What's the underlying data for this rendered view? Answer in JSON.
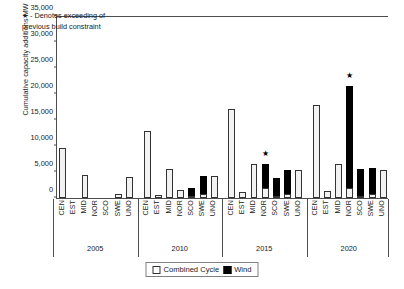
{
  "chart_data": {
    "type": "bar",
    "subtype": "stacked-grouped-bar",
    "title": "",
    "xlabel": "",
    "ylabel": "Cumulative capacity additions MW",
    "ylim": [
      0,
      35000
    ],
    "ytick_step": 5000,
    "yticks": [
      "0",
      "5,000",
      "10,000",
      "15,000",
      "20,000",
      "25,000",
      "30,000",
      "35,000"
    ],
    "grid": false,
    "legend_position": "bottom-center",
    "annotation": {
      "star_glyph": "★",
      "line1": "★  - Denotes exceeding of",
      "line2": "previous build constraint"
    },
    "groups": [
      "2005",
      "2010",
      "2015",
      "2020"
    ],
    "categories": [
      "CEN",
      "EST",
      "MID",
      "NOR",
      "SCO",
      "SWE",
      "UNO"
    ],
    "series": [
      {
        "name": "Combined Cycle",
        "color": "#f2f2f2",
        "edge": "#333333"
      },
      {
        "name": "Wind",
        "color": "#000000",
        "edge": "#000000"
      }
    ],
    "bars": [
      {
        "group": "2005",
        "category": "CEN",
        "combined_cycle": 9650,
        "wind": 0,
        "star": false
      },
      {
        "group": "2005",
        "category": "EST",
        "combined_cycle": 0,
        "wind": 0,
        "star": false
      },
      {
        "group": "2005",
        "category": "MID",
        "combined_cycle": 4500,
        "wind": 0,
        "star": false
      },
      {
        "group": "2005",
        "category": "NOR",
        "combined_cycle": 0,
        "wind": 0,
        "star": false
      },
      {
        "group": "2005",
        "category": "SCO",
        "combined_cycle": 0,
        "wind": 0,
        "star": false
      },
      {
        "group": "2005",
        "category": "SWE",
        "combined_cycle": 700,
        "wind": 0,
        "star": false
      },
      {
        "group": "2005",
        "category": "UNO",
        "combined_cycle": 4100,
        "wind": 0,
        "star": false
      },
      {
        "group": "2010",
        "category": "CEN",
        "combined_cycle": 12900,
        "wind": 0,
        "star": false
      },
      {
        "group": "2010",
        "category": "EST",
        "combined_cycle": 500,
        "wind": 0,
        "star": false
      },
      {
        "group": "2010",
        "category": "MID",
        "combined_cycle": 5650,
        "wind": 0,
        "star": false
      },
      {
        "group": "2010",
        "category": "NOR",
        "combined_cycle": 1600,
        "wind": 0,
        "star": false
      },
      {
        "group": "2010",
        "category": "SCO",
        "combined_cycle": 200,
        "wind": 1550,
        "star": false
      },
      {
        "group": "2010",
        "category": "SWE",
        "combined_cycle": 700,
        "wind": 3450,
        "star": false
      },
      {
        "group": "2010",
        "category": "UNO",
        "combined_cycle": 4250,
        "wind": 0,
        "star": false
      },
      {
        "group": "2015",
        "category": "CEN",
        "combined_cycle": 17050,
        "wind": 0,
        "star": false
      },
      {
        "group": "2015",
        "category": "EST",
        "combined_cycle": 1150,
        "wind": 0,
        "star": false
      },
      {
        "group": "2015",
        "category": "MID",
        "combined_cycle": 6500,
        "wind": 0,
        "star": false
      },
      {
        "group": "2015",
        "category": "NOR",
        "combined_cycle": 2000,
        "wind": 4500,
        "star": true
      },
      {
        "group": "2015",
        "category": "SCO",
        "combined_cycle": 100,
        "wind": 3550,
        "star": false
      },
      {
        "group": "2015",
        "category": "SWE",
        "combined_cycle": 700,
        "wind": 4650,
        "star": false
      },
      {
        "group": "2015",
        "category": "UNO",
        "combined_cycle": 5350,
        "wind": 0,
        "star": false
      },
      {
        "group": "2020",
        "category": "CEN",
        "combined_cycle": 17800,
        "wind": 0,
        "star": false
      },
      {
        "group": "2020",
        "category": "EST",
        "combined_cycle": 1350,
        "wind": 0,
        "star": false
      },
      {
        "group": "2020",
        "category": "MID",
        "combined_cycle": 6550,
        "wind": 0,
        "star": false
      },
      {
        "group": "2020",
        "category": "NOR",
        "combined_cycle": 2000,
        "wind": 19450,
        "star": true
      },
      {
        "group": "2020",
        "category": "SCO",
        "combined_cycle": 100,
        "wind": 5250,
        "star": false
      },
      {
        "group": "2020",
        "category": "SWE",
        "combined_cycle": 700,
        "wind": 5050,
        "star": false
      },
      {
        "group": "2020",
        "category": "UNO",
        "combined_cycle": 5400,
        "wind": 0,
        "star": false
      }
    ]
  },
  "legend": {
    "combined_cycle_label": "Combined Cycle",
    "wind_label": "Wind"
  }
}
